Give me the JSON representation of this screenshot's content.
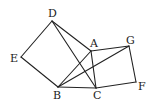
{
  "diagram": {
    "type": "geometry-figure",
    "points": {
      "A": {
        "x": 91,
        "y": 51,
        "label": "A",
        "lx": 90,
        "ly": 47
      },
      "B": {
        "x": 58,
        "y": 87,
        "label": "B",
        "lx": 53,
        "ly": 99
      },
      "C": {
        "x": 96,
        "y": 88,
        "label": "C",
        "lx": 93,
        "ly": 99
      },
      "D": {
        "x": 52,
        "y": 21,
        "label": "D",
        "lx": 48,
        "ly": 17
      },
      "E": {
        "x": 21,
        "y": 57,
        "label": "E",
        "lx": 10,
        "ly": 62
      },
      "F": {
        "x": 136,
        "y": 82,
        "label": "F",
        "lx": 138,
        "ly": 90
      },
      "G": {
        "x": 129,
        "y": 46,
        "label": "G",
        "lx": 126,
        "ly": 44
      }
    },
    "segments": [
      [
        "D",
        "E"
      ],
      [
        "E",
        "B"
      ],
      [
        "D",
        "A"
      ],
      [
        "A",
        "B"
      ],
      [
        "D",
        "C"
      ],
      [
        "B",
        "C"
      ],
      [
        "A",
        "C"
      ],
      [
        "A",
        "G"
      ],
      [
        "G",
        "F"
      ],
      [
        "F",
        "C"
      ],
      [
        "B",
        "G"
      ]
    ]
  }
}
